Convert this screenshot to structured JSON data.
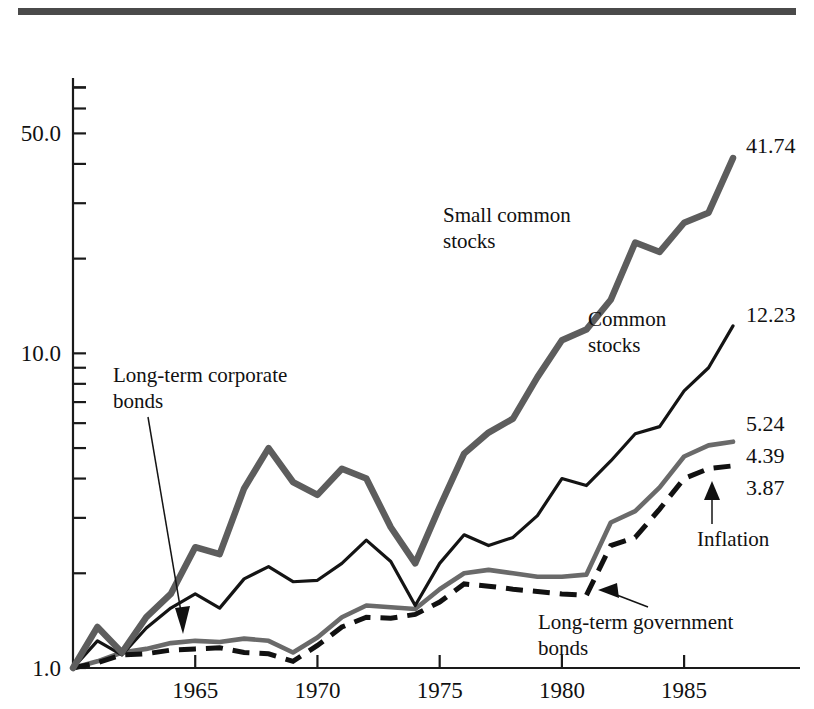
{
  "figure": {
    "background": "#ffffff",
    "rule_bar_color": "#4a4a4a"
  },
  "axis": {
    "y_ticks_labeled": [
      "50.0",
      "10.0",
      "1.0"
    ],
    "y_tick_values": [
      50.0,
      10.0,
      1.0
    ],
    "x_ticks_labeled": [
      "1965",
      "1970",
      "1975",
      "1980",
      "1985"
    ],
    "x_tick_values": [
      1965,
      1970,
      1975,
      1980,
      1985
    ]
  },
  "annotations": {
    "small_stocks": "Small common\nstocks",
    "small_stocks_line1": "Small common",
    "small_stocks_line2": "stocks",
    "common_stocks_line1": "Common",
    "common_stocks_line2": "stocks",
    "corporate_bonds_line1": "Long-term corporate",
    "corporate_bonds_line2": "bonds",
    "government_bonds_line1": "Long-term government",
    "government_bonds_line2": "bonds",
    "inflation": "Inflation"
  },
  "end_labels": {
    "small_stocks": "41.74",
    "common_stocks": "12.23",
    "corporate_bonds": "5.24",
    "government_bonds": "4.39",
    "inflation": "3.87"
  },
  "chart_data": {
    "type": "line",
    "title": "",
    "subtitle": "",
    "xlabel": "",
    "ylabel": "",
    "yscale": "log",
    "ylim": [
      1.0,
      75.0
    ],
    "xlim": [
      1960,
      1987
    ],
    "grid": false,
    "legend": "inline-annotations",
    "x": [
      1960,
      1961,
      1962,
      1963,
      1964,
      1965,
      1966,
      1967,
      1968,
      1969,
      1970,
      1971,
      1972,
      1973,
      1974,
      1975,
      1976,
      1977,
      1978,
      1979,
      1980,
      1981,
      1982,
      1983,
      1984,
      1985,
      1986,
      1987
    ],
    "series": [
      {
        "name": "Small common stocks",
        "end_value": 41.74,
        "style": "thick-gray-solid",
        "color": "#5d5d5d",
        "values": [
          1.0,
          1.35,
          1.12,
          1.45,
          1.72,
          2.42,
          2.3,
          3.72,
          5.0,
          3.9,
          3.55,
          4.3,
          4.0,
          2.8,
          2.15,
          3.25,
          4.8,
          5.6,
          6.2,
          8.4,
          11.0,
          11.9,
          14.8,
          22.5,
          21.0,
          26.0,
          28.0,
          41.74
        ]
      },
      {
        "name": "Common stocks",
        "end_value": 12.23,
        "style": "thin-black-solid",
        "color": "#141414",
        "values": [
          1.0,
          1.22,
          1.1,
          1.34,
          1.55,
          1.72,
          1.55,
          1.92,
          2.1,
          1.88,
          1.9,
          2.15,
          2.55,
          2.18,
          1.58,
          2.15,
          2.65,
          2.45,
          2.6,
          3.05,
          4.0,
          3.8,
          4.55,
          5.55,
          5.85,
          7.6,
          9.0,
          12.23
        ]
      },
      {
        "name": "Long-term corporate bonds",
        "end_value": 5.24,
        "style": "medium-gray-solid",
        "color": "#6a6a6a",
        "values": [
          1.0,
          1.05,
          1.12,
          1.15,
          1.2,
          1.22,
          1.21,
          1.24,
          1.22,
          1.12,
          1.25,
          1.45,
          1.58,
          1.56,
          1.54,
          1.78,
          2.0,
          2.05,
          2.0,
          1.95,
          1.95,
          1.98,
          2.9,
          3.15,
          3.75,
          4.7,
          5.1,
          5.24
        ]
      },
      {
        "name": "Long-term government bonds",
        "end_value": 4.39,
        "style": "thick-black-dashed",
        "color": "#111111",
        "values": [
          1.0,
          1.04,
          1.1,
          1.11,
          1.14,
          1.15,
          1.16,
          1.12,
          1.11,
          1.05,
          1.18,
          1.35,
          1.45,
          1.44,
          1.48,
          1.62,
          1.85,
          1.82,
          1.78,
          1.75,
          1.72,
          1.7,
          2.45,
          2.6,
          3.2,
          4.0,
          4.3,
          4.39
        ]
      },
      {
        "name": "Inflation",
        "end_value": 3.87,
        "style": "thin-black-straight",
        "color": "#141414",
        "values": [
          1.0,
          1.02,
          1.04,
          1.06,
          1.09,
          1.12,
          1.16,
          1.2,
          1.26,
          1.34,
          1.42,
          1.47,
          1.53,
          1.66,
          1.86,
          2.0,
          2.1,
          2.25,
          2.45,
          2.78,
          3.12,
          3.38,
          3.5,
          3.6,
          3.7,
          3.78,
          3.82,
          3.87
        ]
      }
    ]
  }
}
